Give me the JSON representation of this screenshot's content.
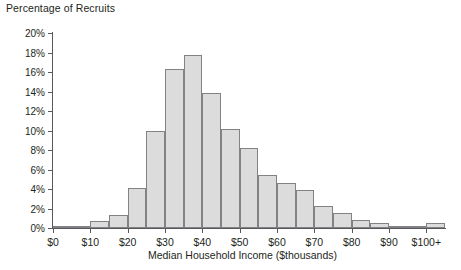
{
  "chart_data": {
    "type": "bar",
    "title": "Percentage of Recruits",
    "xlabel": "Median Household Income ($thousands)",
    "ylabel": "Percentage of Recruits",
    "ylim": [
      0,
      20
    ],
    "ytick_step": 2,
    "grid": false,
    "legend": null,
    "bin_width": 5,
    "xlim": [
      0,
      105
    ],
    "ytick_labels": [
      "0%",
      "2%",
      "4%",
      "6%",
      "8%",
      "10%",
      "12%",
      "14%",
      "16%",
      "18%",
      "20%"
    ],
    "ytick_values": [
      0,
      2,
      4,
      6,
      8,
      10,
      12,
      14,
      16,
      18,
      20
    ],
    "xtick_labels": [
      "$0",
      "$10",
      "$20",
      "$30",
      "$40",
      "$50",
      "$60",
      "$70",
      "$80",
      "$90",
      "$100+"
    ],
    "xtick_values": [
      0,
      10,
      20,
      30,
      40,
      50,
      60,
      70,
      80,
      90,
      100
    ],
    "categories": [
      "0-5",
      "5-10",
      "10-15",
      "15-20",
      "20-25",
      "25-30",
      "30-35",
      "35-40",
      "40-45",
      "45-50",
      "50-55",
      "55-60",
      "60-65",
      "65-70",
      "70-75",
      "75-80",
      "80-85",
      "85-90",
      "90-95",
      "95-100",
      "100+"
    ],
    "bin_starts": [
      0,
      5,
      10,
      15,
      20,
      25,
      30,
      35,
      40,
      45,
      50,
      55,
      60,
      65,
      70,
      75,
      80,
      85,
      90,
      95,
      100
    ],
    "values": [
      0.05,
      0.2,
      0.7,
      1.3,
      4.1,
      10.0,
      16.3,
      17.7,
      13.8,
      10.2,
      8.2,
      5.4,
      4.6,
      3.9,
      2.3,
      1.5,
      0.8,
      0.5,
      0.25,
      0.15,
      0.5
    ]
  },
  "style": {
    "bar_fill": "#dcdcdc",
    "bar_border": "#808285",
    "axis_color": "#58595b",
    "text_color": "#231f20",
    "background": "#ffffff"
  }
}
